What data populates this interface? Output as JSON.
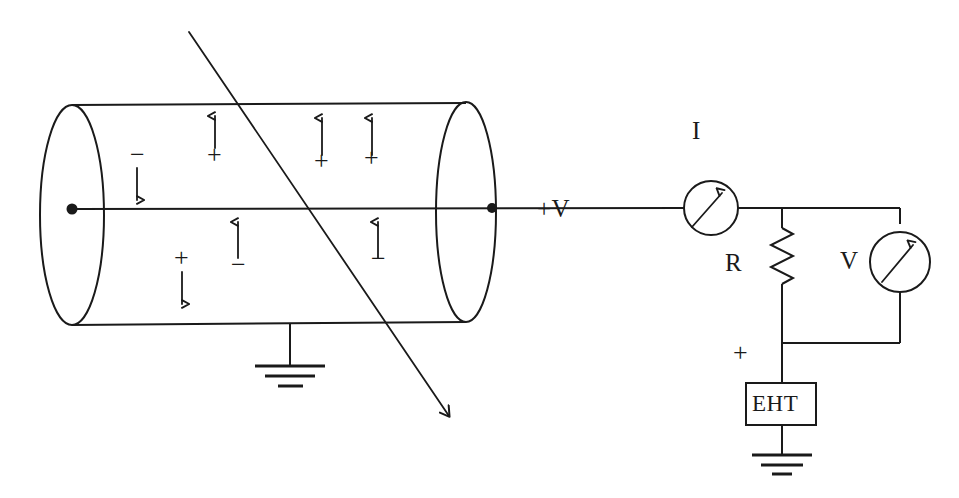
{
  "diagram": {
    "background_color": "#ffffff",
    "ink_color": "#1a1a1a"
  },
  "chamber": {
    "name": "ionisation-chamber",
    "electrode_label": "+V",
    "ground_symbol": "earth",
    "ion_pairs": [
      {
        "sign": "−",
        "arrow": "down",
        "region": "upper"
      },
      {
        "sign": "+",
        "arrow": "up",
        "region": "upper"
      },
      {
        "sign": "+",
        "arrow": "up",
        "region": "upper"
      },
      {
        "sign": "+",
        "arrow": "up",
        "region": "upper"
      },
      {
        "sign": "+",
        "arrow": "down",
        "region": "lower"
      },
      {
        "sign": "−",
        "arrow": "up",
        "region": "lower"
      },
      {
        "sign": "−",
        "arrow": "up",
        "region": "lower"
      }
    ],
    "particle_track": "ionising-particle-track-arrow"
  },
  "circuit": {
    "ammeter": {
      "label": "I",
      "symbol": "meter-with-needle"
    },
    "resistor": {
      "label": "R",
      "symbol": "zigzag-resistor"
    },
    "voltmeter": {
      "label": "V",
      "symbol": "meter-with-needle"
    },
    "supply": {
      "label": "EHT",
      "polarity_label": "+",
      "ground_symbol": "earth"
    }
  }
}
